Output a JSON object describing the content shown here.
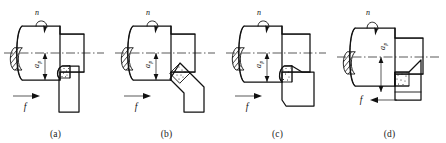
{
  "figure": {
    "background_color": "#ffffff",
    "ink_color": "#111111",
    "panel_count": 4
  },
  "symbols": {
    "rotation": "n",
    "feed": "f",
    "depth_of_cut": "a",
    "depth_of_cut_subscript": "p"
  },
  "panels": [
    {
      "caption": "(a)",
      "rotation_label": "n",
      "feed_label": "f",
      "depth_label": "a",
      "depth_label_sub": "p",
      "feed_direction": "right",
      "tool_type": "straight-shank-turning-tool",
      "insert_style": "hatched-rounded"
    },
    {
      "caption": "(b)",
      "rotation_label": "n",
      "feed_label": "f",
      "depth_label": "a",
      "depth_label_sub": "p",
      "feed_direction": "right",
      "tool_type": "angled-rhombic-insert-tool",
      "insert_style": "speckled-diamond"
    },
    {
      "caption": "(c)",
      "rotation_label": "n",
      "feed_label": "f",
      "depth_label": "a",
      "depth_label_sub": "p",
      "feed_direction": "right",
      "tool_type": "right-hand-offset-turning-tool",
      "insert_style": "speckled-rounded"
    },
    {
      "caption": "(d)",
      "rotation_label": "n",
      "feed_label": "f",
      "depth_label": "a",
      "depth_label_sub": "p",
      "feed_direction": "left",
      "tool_type": "facing-tool",
      "insert_style": "speckled-square"
    }
  ]
}
